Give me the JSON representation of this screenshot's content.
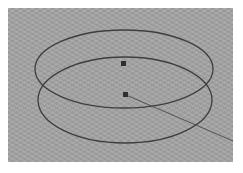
{
  "viewport": {
    "name": "3D viewport",
    "background_color": "#a3a3a3",
    "curve_color": "#3e3e3e",
    "objects": [
      {
        "type": "circle",
        "label": "upper-circle"
      },
      {
        "type": "circle",
        "label": "lower-circle"
      }
    ],
    "pivots": [
      {
        "label": "upper-circle-pivot"
      },
      {
        "label": "lower-circle-pivot"
      }
    ],
    "guide_line": {
      "label": "guide-line"
    }
  }
}
